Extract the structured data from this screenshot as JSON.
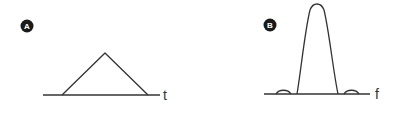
{
  "panels": [
    {
      "badge": "A",
      "axis_label": "t",
      "shape": "triangle-pulse",
      "domain": "time"
    },
    {
      "badge": "B",
      "axis_label": "f",
      "shape": "sinc-squared-spectrum",
      "domain": "frequency"
    }
  ],
  "colors": {
    "line": "#333333",
    "badge_fill": "#1a1a1a",
    "badge_text": "#ffffff",
    "background": "#ffffff"
  }
}
